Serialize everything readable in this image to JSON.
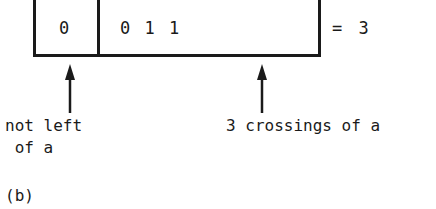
{
  "diagram": {
    "register": {
      "first_cell": "0",
      "second_cell": "0 1 1",
      "result": "= 3"
    },
    "annotations": {
      "left_label_line1": "not left",
      "left_label_line2": " of a",
      "right_label": "3 crossings of a"
    },
    "caption": "(b)",
    "colors": {
      "ink": "#1a1a1a",
      "background": "#ffffff"
    }
  }
}
